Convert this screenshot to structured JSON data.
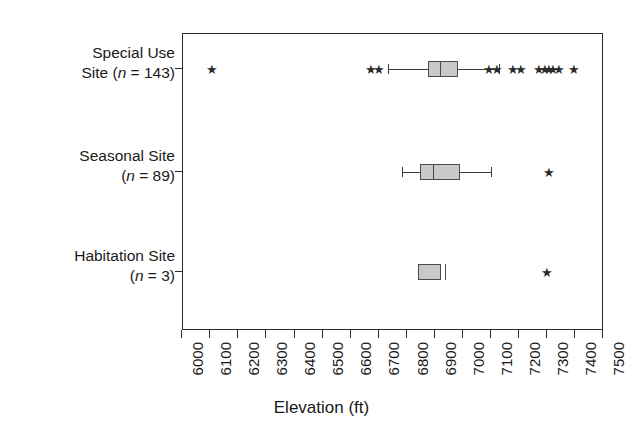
{
  "chart_data": {
    "type": "box",
    "title": "",
    "xlabel": "Elevation (ft)",
    "ylabel": "",
    "xlim": [
      6000,
      7500
    ],
    "xticks": [
      6000,
      6100,
      6200,
      6300,
      6400,
      6500,
      6600,
      6700,
      6800,
      6900,
      7000,
      7100,
      7200,
      7300,
      7400,
      7500
    ],
    "xticklabels": [
      "6000",
      "6100",
      "6200",
      "6300",
      "6400",
      "6500",
      "6600",
      "6700",
      "6800",
      "6900",
      "7000",
      "7100",
      "7200",
      "7300",
      "7400",
      "7500"
    ],
    "grid": false,
    "legend": null,
    "orientation": "horizontal",
    "categories": [
      {
        "label_line1": "Special Use",
        "label_line2_pre": "Site (",
        "label_line2_var": "n",
        "label_line2_post": " = 143)",
        "name": "Special Use Site",
        "n": 143,
        "whisker_low": 6735,
        "q1": 6877,
        "median": 6923,
        "q3": 6983,
        "whisker_high": 7133,
        "outliers": [
          6107,
          6673,
          6702,
          7095,
          7123,
          7180,
          7209,
          7273,
          7294,
          7308,
          7323,
          7345,
          7395
        ]
      },
      {
        "label_line1": "Seasonal Site",
        "label_line2_pre": "(",
        "label_line2_var": "n",
        "label_line2_post": " = 89)",
        "name": "Seasonal Site",
        "n": 89,
        "whisker_low": 6788,
        "q1": 6848,
        "median": 6895,
        "q3": 6990,
        "whisker_high": 7105,
        "outliers": [
          7307
        ]
      },
      {
        "label_line1": "Habitation Site",
        "label_line2_pre": "(",
        "label_line2_var": "n",
        "label_line2_post": " = 3)",
        "name": "Habitation Site",
        "n": 3,
        "whisker_low": null,
        "q1": 6841,
        "median": 6941,
        "q3": 6923,
        "whisker_high": null,
        "outliers": [
          7300
        ]
      }
    ],
    "colors": {
      "box_fill": "#c9c9c9",
      "box_edge": "#4a4a4a",
      "axis": "#2b2b2b",
      "marker": "#2b2b2b",
      "background": "#ffffff"
    },
    "outlier_marker": "★"
  }
}
